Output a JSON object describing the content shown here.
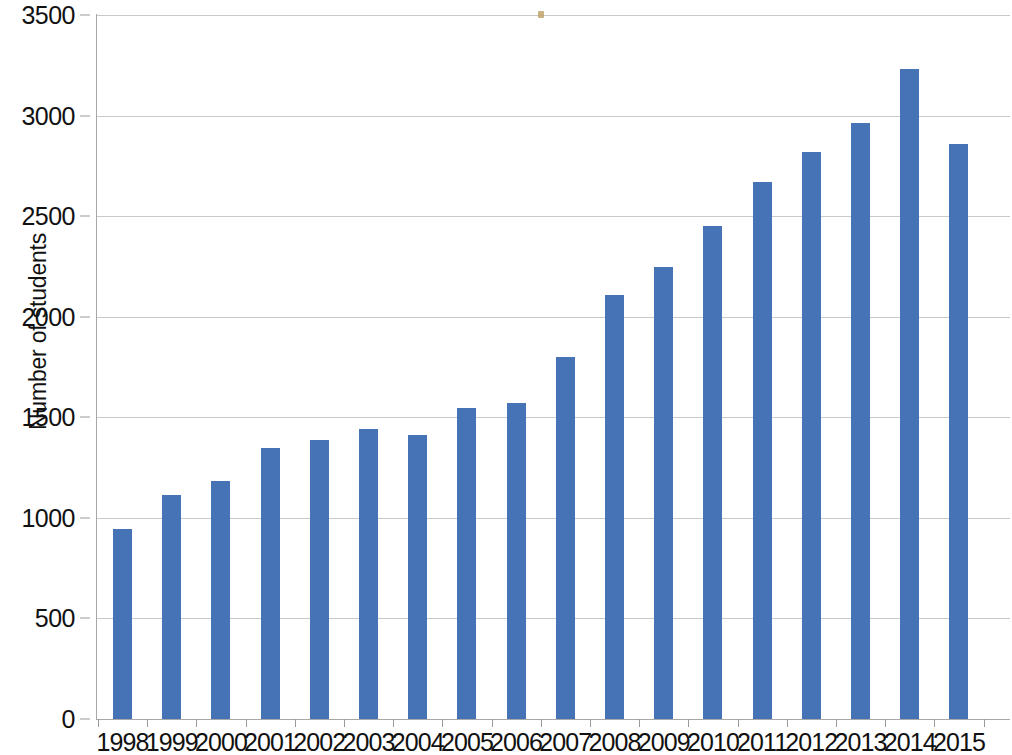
{
  "chart_data": {
    "type": "bar",
    "title": "",
    "subtitle": "",
    "xlabel": "",
    "ylabel": "Number of students",
    "categories": [
      "1998",
      "1999",
      "2000",
      "2001",
      "2002",
      "2003",
      "2004",
      "2005",
      "2006",
      "2007",
      "2008",
      "2009",
      "2010",
      "2011",
      "2012",
      "2013",
      "2014",
      "2015"
    ],
    "values": [
      945,
      1115,
      1185,
      1345,
      1385,
      1440,
      1410,
      1545,
      1570,
      1800,
      2110,
      2245,
      2450,
      2670,
      2820,
      2965,
      3230,
      2860
    ],
    "series": [
      {
        "name": "Number of students",
        "values": [
          945,
          1115,
          1185,
          1345,
          1385,
          1440,
          1410,
          1545,
          1570,
          1800,
          2110,
          2245,
          2450,
          2670,
          2820,
          2965,
          3230,
          2860
        ],
        "color": "#4573b5"
      }
    ],
    "ylim": [
      0,
      3500
    ],
    "y_ticks": [
      0,
      500,
      1000,
      1500,
      2000,
      2500,
      3000,
      3500
    ],
    "y_tick_labels": [
      "0",
      "500",
      "1000",
      "1500",
      "2000",
      "2500",
      "3000",
      "3500"
    ],
    "grid": true,
    "grid_axis": "y",
    "legend": false,
    "legend_position": "none",
    "bar_color": "#4573b5",
    "gridline_color": "#c9c9c9",
    "axis_color": "#a8a8a8",
    "text_color": "#111111",
    "background": "#ffffff"
  }
}
